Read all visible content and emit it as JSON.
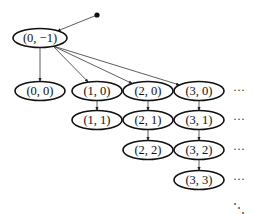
{
  "diagram": {
    "type": "directed-tree",
    "start_point": {
      "x": 97,
      "y": 15
    },
    "root": {
      "id": "n0m1",
      "label": "(0, −1)",
      "x": 40,
      "y": 38
    },
    "nodes": [
      {
        "id": "n00",
        "label": "(0, 0)",
        "x": 40,
        "y": 91
      },
      {
        "id": "n10",
        "label": "(1, 0)",
        "x": 97,
        "y": 91
      },
      {
        "id": "n20",
        "label": "(2, 0)",
        "x": 148,
        "y": 91
      },
      {
        "id": "n30",
        "label": "(3, 0)",
        "x": 199,
        "y": 91
      },
      {
        "id": "n11",
        "label": "(1, 1)",
        "x": 97,
        "y": 120
      },
      {
        "id": "n21",
        "label": "(2, 1)",
        "x": 148,
        "y": 120
      },
      {
        "id": "n31",
        "label": "(3, 1)",
        "x": 199,
        "y": 120
      },
      {
        "id": "n22",
        "label": "(2, 2)",
        "x": 148,
        "y": 150
      },
      {
        "id": "n32",
        "label": "(3, 2)",
        "x": 199,
        "y": 150
      },
      {
        "id": "n33",
        "label": "(3, 3)",
        "x": 199,
        "y": 180
      }
    ],
    "edges": [
      [
        "start",
        "n0m1"
      ],
      [
        "n0m1",
        "n00"
      ],
      [
        "n0m1",
        "n10"
      ],
      [
        "n0m1",
        "n20"
      ],
      [
        "n0m1",
        "n30"
      ],
      [
        "n10",
        "n11"
      ],
      [
        "n20",
        "n21"
      ],
      [
        "n21",
        "n22"
      ],
      [
        "n30",
        "n31"
      ],
      [
        "n31",
        "n32"
      ],
      [
        "n32",
        "n33"
      ]
    ],
    "continuation": {
      "row_ellipsis": "···",
      "diagonal_ellipsis": "⋱",
      "row_ys": [
        91,
        120,
        150,
        180
      ],
      "ellipsis_x": 239,
      "diagonal": {
        "x": 239,
        "y": 208
      }
    },
    "colors": {
      "stroke": "#111111",
      "edge": "#333333",
      "background": "#ffffff"
    }
  }
}
